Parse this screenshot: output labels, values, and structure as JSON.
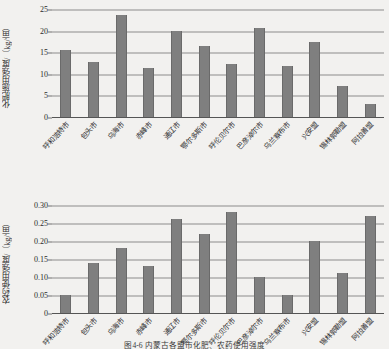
{
  "figure": {
    "caption": "图4-6  内蒙古各盟市化肥、农药使用强度",
    "bar_color": "#7f7f7f",
    "grid_color": "#8c8c8c"
  },
  "categories": [
    "呼和浩特市",
    "包头市",
    "乌海市",
    "赤峰市",
    "通辽市",
    "鄂尔多斯市",
    "呼伦贝尔市",
    "巴彦淖尔市",
    "乌兰察布市",
    "兴安盟",
    "锡林郭勒盟",
    "阿拉善盟"
  ],
  "chart_data": [
    {
      "type": "bar",
      "id": "fertilizer",
      "title": "",
      "xlabel": "",
      "ylabel": "化肥施用强度/（kg/亩）",
      "ylim": [
        0,
        25
      ],
      "yticks": [
        "0",
        "5",
        "10",
        "15",
        "20",
        "25"
      ],
      "ytick_values": [
        0,
        5,
        10,
        15,
        20,
        25
      ],
      "grid": true,
      "legend": "none",
      "categories": [
        "呼和浩特市",
        "包头市",
        "乌海市",
        "赤峰市",
        "通辽市",
        "鄂尔多斯市",
        "呼伦贝尔市",
        "巴彦淖尔市",
        "乌兰察布市",
        "兴安盟",
        "锡林郭勒盟",
        "阿拉善盟"
      ],
      "values": [
        15.4,
        12.7,
        23.7,
        11.4,
        19.8,
        16.4,
        12.3,
        20.6,
        11.9,
        17.4,
        7.1,
        3.1
      ]
    },
    {
      "type": "bar",
      "id": "pesticide",
      "title": "",
      "xlabel": "",
      "ylabel": "农药使用强度/（kg/亩）",
      "ylim": [
        0,
        0.3
      ],
      "yticks": [
        "0",
        "0.05",
        "0.10",
        "0.15",
        "0.20",
        "0.25",
        "0.30"
      ],
      "ytick_values": [
        0,
        0.05,
        0.1,
        0.15,
        0.2,
        0.25,
        0.3
      ],
      "grid": true,
      "legend": "none",
      "categories": [
        "呼和浩特市",
        "包头市",
        "乌海市",
        "赤峰市",
        "通辽市",
        "鄂尔多斯市",
        "呼伦贝尔市",
        "巴彦淖尔市",
        "乌兰察布市",
        "兴安盟",
        "锡林郭勒盟",
        "阿拉善盟"
      ],
      "values": [
        0.05,
        0.14,
        0.18,
        0.13,
        0.26,
        0.22,
        0.28,
        0.1,
        0.05,
        0.2,
        0.11,
        0.27
      ]
    }
  ]
}
